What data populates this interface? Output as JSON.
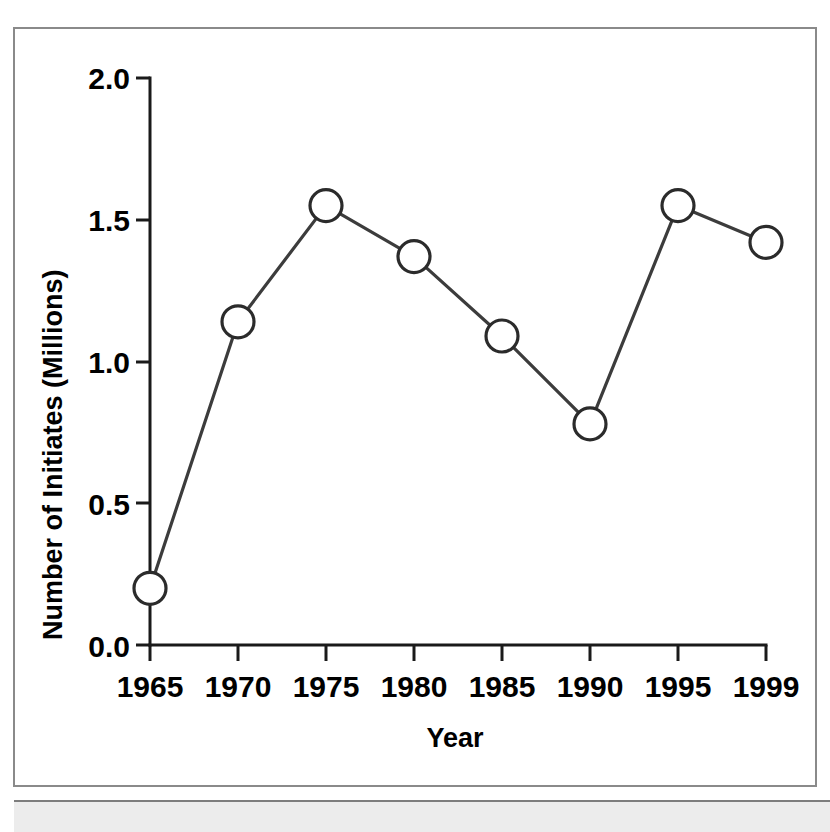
{
  "figure": {
    "background_color": "#ffffff",
    "frame_color": "#8a8a8a",
    "bottom_strip_color": "#ececec"
  },
  "chart_data": {
    "type": "line",
    "title": "",
    "subtitle": "",
    "xlabel": "Year",
    "ylabel": "Number of Initiates (Millions)",
    "categories": [
      "1965",
      "1970",
      "1975",
      "1980",
      "1985",
      "1990",
      "1995",
      "1999"
    ],
    "x": [
      1965,
      1970,
      1975,
      1980,
      1985,
      1990,
      1995,
      1999
    ],
    "values": [
      0.2,
      1.14,
      1.55,
      1.37,
      1.09,
      0.78,
      1.55,
      1.42
    ],
    "series": [
      {
        "name": "Number of Initiates",
        "values": [
          0.2,
          1.14,
          1.55,
          1.37,
          1.09,
          0.78,
          1.55,
          1.42
        ],
        "line_color": "#3c3c3c",
        "marker": "open-circle",
        "marker_fill": "#ffffff",
        "marker_edge_color": "#2b2b2b"
      }
    ],
    "xlim": [
      1965,
      1999
    ],
    "ylim": [
      0.0,
      2.0
    ],
    "ytick_labels": [
      "0.0",
      "0.5",
      "1.0",
      "1.5",
      "2.0"
    ],
    "ytick_values": [
      0.0,
      0.5,
      1.0,
      1.5,
      2.0
    ],
    "xtick_labels": [
      "1965",
      "1970",
      "1975",
      "1980",
      "1985",
      "1990",
      "1995",
      "1999"
    ],
    "grid": false,
    "legend": false,
    "legend_position": "none"
  }
}
